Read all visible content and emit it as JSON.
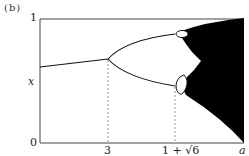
{
  "figure": {
    "panel_label": "(b)",
    "y_axis": {
      "variable": "x",
      "ticks": [
        "0",
        "1"
      ]
    },
    "x_axis": {
      "variable": "a",
      "ticks": [
        "3",
        "1 + √6"
      ]
    },
    "colors": {
      "line": "#111111",
      "fill": "#000000",
      "guide": "#777777",
      "axis": "#444444"
    }
  }
}
